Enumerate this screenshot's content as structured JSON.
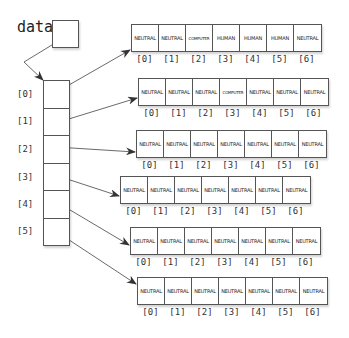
{
  "variable": {
    "name": "data"
  },
  "outer_array": {
    "indices": [
      "[0]",
      "[1]",
      "[2]",
      "[3]",
      "[4]",
      "[5]"
    ]
  },
  "inner_arrays": [
    {
      "cells": [
        "NEUTRAL",
        "NEUTRAL",
        "COMPUTER",
        "HUMAN",
        "HUMAN",
        "HUMAN",
        "NEUTRAL"
      ]
    },
    {
      "cells": [
        "NEUTRAL",
        "NEUTRAL",
        "NEUTRAL",
        "COMPUTER",
        "NEUTRAL",
        "NEUTRAL",
        "NEUTRAL"
      ]
    },
    {
      "cells": [
        "NEUTRAL",
        "NEUTRAL",
        "NEUTRAL",
        "NEUTRAL",
        "NEUTRAL",
        "NEUTRAL",
        "NEUTRAL"
      ]
    },
    {
      "cells": [
        "NEUTRAL",
        "NEUTRAL",
        "NEUTRAL",
        "NEUTRAL",
        "NEUTRAL",
        "NEUTRAL",
        "NEUTRAL"
      ]
    },
    {
      "cells": [
        "NEUTRAL",
        "NEUTRAL",
        "NEUTRAL",
        "NEUTRAL",
        "NEUTRAL",
        "NEUTRAL",
        "NEUTRAL"
      ]
    },
    {
      "cells": [
        "NEUTRAL",
        "NEUTRAL",
        "NEUTRAL",
        "NEUTRAL",
        "NEUTRAL",
        "NEUTRAL",
        "NEUTRAL"
      ]
    }
  ],
  "inner_indices": [
    "[0]",
    "[1]",
    "[2]",
    "[3]",
    "[4]",
    "[5]",
    "[6]"
  ],
  "colors": {
    "stroke": "#555555",
    "arrow": "#333333",
    "text": "#222222"
  }
}
